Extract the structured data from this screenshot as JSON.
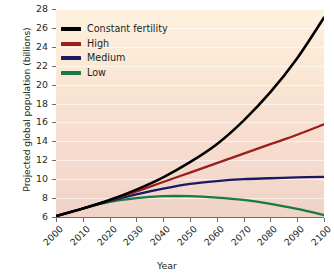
{
  "chart_data": {
    "type": "line",
    "title": "",
    "xlabel": "Year",
    "ylabel": "Projected global population (billions)",
    "xlim": [
      2000,
      2100
    ],
    "ylim": [
      6,
      28
    ],
    "grid": "horizontal",
    "legend_position": "top-left",
    "x_ticks": [
      "2000",
      "2010",
      "2020",
      "2030",
      "2040",
      "2050",
      "2060",
      "2070",
      "2080",
      "2090",
      "2100"
    ],
    "y_ticks": [
      "6",
      "8",
      "10",
      "12",
      "14",
      "16",
      "18",
      "20",
      "22",
      "24",
      "26",
      "28"
    ],
    "x": [
      2000,
      2010,
      2020,
      2030,
      2040,
      2050,
      2060,
      2070,
      2080,
      2090,
      2100
    ],
    "series": [
      {
        "name": "Constant fertility",
        "color": "#000000",
        "values": [
          6.1,
          6.9,
          7.8,
          8.9,
          10.2,
          11.8,
          13.7,
          16.2,
          19.2,
          22.8,
          27.1
        ]
      },
      {
        "name": "High",
        "color": "#9d1c1c",
        "values": [
          6.1,
          6.9,
          7.8,
          8.7,
          9.7,
          10.7,
          11.7,
          12.7,
          13.7,
          14.7,
          15.8
        ]
      },
      {
        "name": "Medium",
        "color": "#1a1a64",
        "values": [
          6.1,
          6.9,
          7.7,
          8.4,
          9.0,
          9.5,
          9.8,
          10.0,
          10.1,
          10.2,
          10.25
        ]
      },
      {
        "name": "Low",
        "color": "#1b7a40",
        "values": [
          6.1,
          6.9,
          7.6,
          8.0,
          8.2,
          8.2,
          8.05,
          7.8,
          7.4,
          6.85,
          6.2
        ]
      }
    ]
  },
  "legend": {
    "items": [
      {
        "label": "Constant fertility",
        "color": "#000000"
      },
      {
        "label": "High",
        "color": "#9d1c1c"
      },
      {
        "label": "Medium",
        "color": "#1a1a64"
      },
      {
        "label": "Low",
        "color": "#1b7a40"
      }
    ]
  },
  "axes": {
    "x_title": "Year",
    "y_title": "Projected global population (billions)"
  },
  "colors": {
    "plot_bg_top": "#fdf1de",
    "plot_bg_bottom": "#f0d2c6",
    "axis": "#6d6e71",
    "text": "#231f20",
    "page_bg": "#ffffff"
  }
}
